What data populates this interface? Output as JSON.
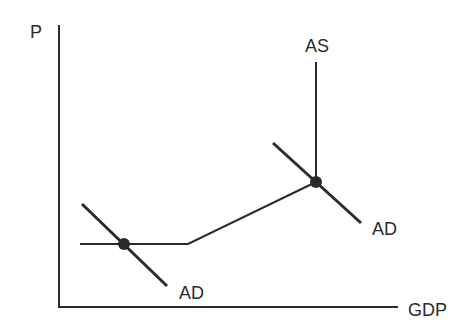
{
  "axes": {
    "y_label": "P",
    "x_label": "GDP"
  },
  "curves": {
    "as_label": "AS",
    "ad_low_label": "AD",
    "ad_high_label": "AD"
  },
  "colors": {
    "line": "#2b2b2b",
    "background": "#ffffff"
  }
}
